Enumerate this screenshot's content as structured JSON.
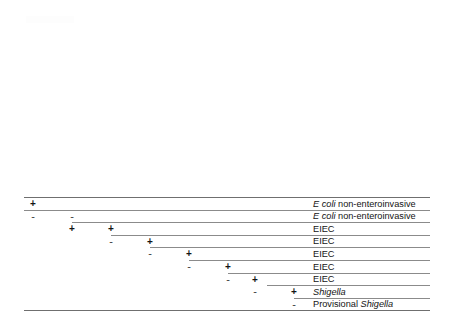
{
  "figure": {
    "type": "identification-key-table",
    "title": "",
    "columns": [
      {
        "label": "LDC",
        "footnote": "a",
        "italic_part": "",
        "x": 33
      },
      {
        "label": "ipaH-gene PCR",
        "footnote": "b",
        "italic_part": "ipaH",
        "x": 72
      },
      {
        "label": "Motility",
        "footnote": "c",
        "italic_part": "",
        "x": 111
      },
      {
        "label": "Salicin, acid",
        "footnote": "a",
        "italic_part": "",
        "x": 150
      },
      {
        "label": "Esculin hydrolysis",
        "footnote": "a",
        "italic_part": "",
        "x": 189
      },
      {
        "label": "Gas from D-Glucose and indol",
        "footnote": "a",
        "italic_part": "",
        "x": 228
      },
      {
        "label": "Agglutination with EIEC associated antisera",
        "footnote": "d",
        "italic_part": "",
        "x": 255
      },
      {
        "label": "Agglutination with Shigella antisera",
        "footnote": "",
        "italic_part": "Shigella",
        "x": 294
      }
    ],
    "rows": [
      {
        "marks": [
          {
            "col": 0,
            "sign": "+"
          }
        ],
        "outcome": "E  coli non-enteroinvasive",
        "outcome_italic": "E  coli",
        "outcome_rest": " non-enteroinvasive",
        "rule_start": 0
      },
      {
        "marks": [
          {
            "col": 0,
            "sign": "-"
          },
          {
            "col": 1,
            "sign": "-"
          }
        ],
        "outcome": "E  coli non-enteroinvasive",
        "outcome_italic": "E  coli",
        "outcome_rest": " non-enteroinvasive",
        "rule_start": 0
      },
      {
        "marks": [
          {
            "col": 1,
            "sign": "+"
          },
          {
            "col": 2,
            "sign": "+"
          }
        ],
        "outcome": "EIEC",
        "outcome_italic": "",
        "outcome_rest": "EIEC",
        "rule_start": 48
      },
      {
        "marks": [
          {
            "col": 2,
            "sign": "-"
          },
          {
            "col": 3,
            "sign": "+"
          }
        ],
        "outcome": "EIEC",
        "outcome_italic": "",
        "outcome_rest": "EIEC",
        "rule_start": 87
      },
      {
        "marks": [
          {
            "col": 3,
            "sign": "-"
          },
          {
            "col": 4,
            "sign": "+"
          }
        ],
        "outcome": "EIEC",
        "outcome_italic": "",
        "outcome_rest": "EIEC",
        "rule_start": 126
      },
      {
        "marks": [
          {
            "col": 4,
            "sign": "-"
          },
          {
            "col": 5,
            "sign": "+"
          }
        ],
        "outcome": "EIEC",
        "outcome_italic": "",
        "outcome_rest": "EIEC",
        "rule_start": 165
      },
      {
        "marks": [
          {
            "col": 5,
            "sign": "-"
          },
          {
            "col": 6,
            "sign": "+"
          }
        ],
        "outcome": "EIEC",
        "outcome_italic": "",
        "outcome_rest": "EIEC",
        "rule_start": 204
      },
      {
        "marks": [
          {
            "col": 6,
            "sign": "-"
          },
          {
            "col": 7,
            "sign": "+"
          }
        ],
        "outcome": "Shigella",
        "outcome_italic": "Shigella",
        "outcome_rest": "",
        "rule_start": 243
      },
      {
        "marks": [
          {
            "col": 7,
            "sign": "-"
          }
        ],
        "outcome": "Provisional Shigella",
        "outcome_italic": "Shigella",
        "outcome_rest": "",
        "rule_start": 270
      }
    ]
  }
}
